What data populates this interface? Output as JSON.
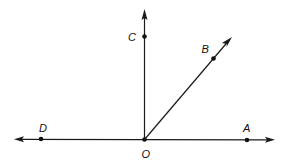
{
  "diagram": {
    "type": "geometry-rays",
    "colors": {
      "line": "#1a1a1a",
      "point": "#111111",
      "background": "#ffffff"
    },
    "points": [
      {
        "id": "O",
        "label": "O",
        "x": 144.5,
        "y": 139.5,
        "label_x": 146,
        "label_y": 157
      },
      {
        "id": "A",
        "label": "A",
        "x": 247,
        "y": 140,
        "label_x": 247,
        "label_y": 132
      },
      {
        "id": "B",
        "label": "B",
        "x": 213.5,
        "y": 58.5,
        "label_x": 206,
        "label_y": 53
      },
      {
        "id": "C",
        "label": "C",
        "x": 144.5,
        "y": 36.5,
        "label_x": 132,
        "label_y": 41
      },
      {
        "id": "D",
        "label": "D",
        "x": 41,
        "y": 139,
        "label_x": 43,
        "label_y": 132
      }
    ],
    "lines": [
      {
        "id": "line-DA",
        "from": [
          20,
          139.3
        ],
        "to": [
          270,
          139.8
        ],
        "arrows": [
          "start",
          "end"
        ]
      },
      {
        "id": "ray-OC",
        "from": [
          144.5,
          139.5
        ],
        "to": [
          144.5,
          12
        ],
        "arrows": [
          "end"
        ]
      },
      {
        "id": "ray-OB",
        "from": [
          144.5,
          139.5
        ],
        "to": [
          230,
          39
        ],
        "arrows": [
          "end"
        ]
      }
    ]
  }
}
